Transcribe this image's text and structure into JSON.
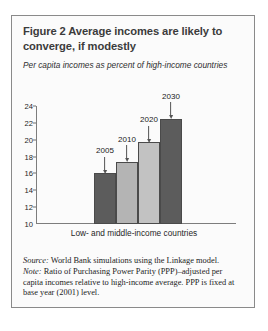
{
  "figure": {
    "title": "Figure 2  Average incomes are likely to converge, if modestly",
    "axis_caption": "Per capita incomes as percent of high-income countries",
    "source_lead": "Source:",
    "source_text": " World Bank simulations using the Linkage model.",
    "note_lead": "Note:",
    "note_text": " Ratio of Purchasing Power Parity (PPP)–adjusted per capita incomes relative to high-income average. PPP is fixed at base year (2001) level."
  },
  "chart_data": {
    "type": "bar",
    "title": "Figure 2  Average incomes are likely to converge, if modestly",
    "subtitle": "Per capita incomes as percent of high-income countries",
    "xlabel": "Low- and middle-income countries",
    "ylabel": "",
    "ylim": [
      10,
      24
    ],
    "yticks": [
      10,
      12,
      14,
      16,
      18,
      20,
      22,
      24
    ],
    "grid": false,
    "legend": "none",
    "categories": [
      "2005",
      "2010",
      "2020",
      "2030"
    ],
    "values": [
      16.0,
      17.4,
      19.7,
      22.5
    ],
    "annotations": [
      {
        "label": "2005",
        "value": 16.0
      },
      {
        "label": "2010",
        "value": 17.4
      },
      {
        "label": "2020",
        "value": 19.7
      },
      {
        "label": "2030",
        "value": 22.5
      }
    ],
    "colors": [
      "#5c5c5c",
      "#b4b4b4",
      "#c2c2c2",
      "#5c5c5c"
    ]
  }
}
